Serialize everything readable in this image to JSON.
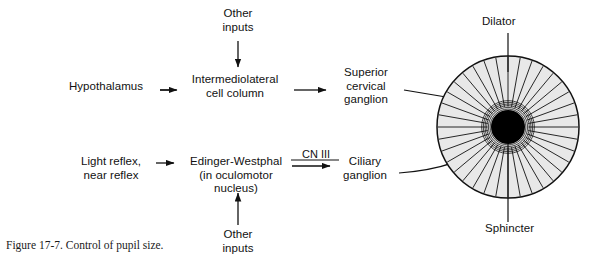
{
  "figure": {
    "caption": "Figure 17-7. Control of pupil size.",
    "background_color": "#ffffff",
    "line_color": "#111111",
    "iris_fill_color": "#e8e8e8",
    "pupil_color": "#000000"
  },
  "nodes": {
    "hypothalamus": "Hypothalamus",
    "intermediolateral_cell_column": "Intermediolateral\ncell column",
    "other_inputs_top": "Other\ninputs",
    "superior_cervical_ganglion": "Superior\ncervical\nganglion",
    "light_near_reflex": "Light reflex,\nnear reflex",
    "edinger_westphal": "Edinger-Westphal\n(in oculomotor nucleus)",
    "other_inputs_bottom": "Other\ninputs",
    "ciliary_ganglion": "Ciliary\nganglion",
    "cn_three": "CN III"
  },
  "eye": {
    "dilator_label": "Dilator",
    "sphincter_label": "Sphincter",
    "iris_radial_lines": 36,
    "sphincter_rings": 6,
    "iris_center_x": 508,
    "iris_center_y": 127,
    "iris_radius": 71,
    "pupil_radius": 17
  },
  "pathways": [
    {
      "name": "sympathetic",
      "from": "Hypothalamus",
      "to": "Intermediolateral cell column"
    },
    {
      "name": "sympathetic",
      "from": "Intermediolateral cell column",
      "to": "Superior cervical ganglion"
    },
    {
      "name": "sympathetic",
      "from": "Superior cervical ganglion",
      "to": "Dilator"
    },
    {
      "name": "parasympathetic",
      "from": "Light reflex, near reflex",
      "to": "Edinger-Westphal"
    },
    {
      "name": "parasympathetic",
      "from": "Edinger-Westphal",
      "to": "Ciliary ganglion",
      "via": "CN III"
    },
    {
      "name": "parasympathetic",
      "from": "Ciliary ganglion",
      "to": "Sphincter"
    },
    {
      "name": "modulatory",
      "from": "Other inputs",
      "to": "Intermediolateral cell column"
    },
    {
      "name": "modulatory",
      "from": "Other inputs",
      "to": "Edinger-Westphal"
    }
  ]
}
